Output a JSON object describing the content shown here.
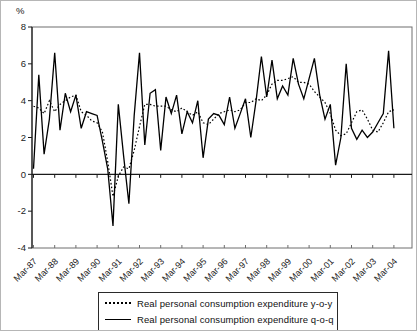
{
  "figure": {
    "y_axis_unit_label": "%",
    "colors": {
      "line": "#000000",
      "frame": "#6e6e6e",
      "axis": "#1a1a1a",
      "tick_text": "#222222",
      "background": "#ffffff"
    },
    "legend": [
      {
        "label": "Real personal consumption expenditure y-o-y",
        "style": "dotted"
      },
      {
        "label": "Real personal consumption expenditure q-o-q",
        "style": "solid"
      }
    ]
  },
  "chart_data": {
    "type": "line",
    "title": "",
    "ylabel": "%",
    "xlabel": "",
    "ylim": [
      -4,
      8
    ],
    "y_ticks": [
      8,
      6,
      4,
      2,
      0,
      -2,
      -4
    ],
    "grid": false,
    "zero_baseline": true,
    "legend_position": "bottom",
    "x_start": "Mar-87",
    "x_frequency": "quarterly",
    "x_points": 69,
    "x_tick_labels": [
      "Mar-87",
      "Mar-88",
      "Mar-89",
      "Mar-90",
      "Mar-91",
      "Mar-92",
      "Mar-93",
      "Mar-94",
      "Mar-95",
      "Mar-96",
      "Mar-97",
      "Mar-98",
      "Mar-99",
      "Mar-00",
      "Mar-01",
      "Mar-02",
      "Mar-03",
      "Mar-04"
    ],
    "series": [
      {
        "name": "Real personal consumption expenditure y-o-y",
        "style": "dotted",
        "values": [
          3.7,
          3.6,
          3.3,
          4.0,
          3.4,
          3.8,
          4.0,
          4.2,
          4.3,
          3.4,
          3.2,
          2.9,
          2.8,
          2.3,
          0.7,
          -1.2,
          -0.1,
          0.4,
          0.3,
          1.3,
          2.6,
          3.8,
          3.8,
          3.7,
          3.7,
          3.7,
          3.5,
          3.4,
          3.6,
          3.4,
          3.2,
          3.4,
          2.8,
          2.7,
          3.0,
          3.3,
          3.4,
          3.5,
          3.4,
          3.5,
          3.9,
          3.9,
          4.1,
          4.0,
          4.3,
          4.9,
          5.1,
          5.1,
          5.2,
          5.3,
          5.0,
          5.0,
          4.9,
          4.5,
          4.2,
          3.9,
          3.3,
          2.4,
          2.1,
          2.2,
          2.8,
          3.4,
          3.5,
          3.0,
          2.4,
          2.3,
          2.8,
          3.4,
          3.5
        ]
      },
      {
        "name": "Real personal consumption expenditure q-o-q",
        "style": "solid",
        "values": [
          0.3,
          5.4,
          1.1,
          3.0,
          6.6,
          2.4,
          4.4,
          3.4,
          4.3,
          2.5,
          3.4,
          3.3,
          3.2,
          1.8,
          0.3,
          -2.8,
          3.8,
          1.0,
          -1.6,
          3.2,
          6.6,
          1.6,
          4.4,
          4.6,
          1.3,
          4.2,
          3.3,
          4.3,
          2.2,
          3.4,
          2.8,
          4.0,
          0.9,
          3.0,
          3.3,
          3.2,
          2.7,
          4.2,
          2.5,
          3.3,
          4.1,
          2.0,
          4.0,
          6.4,
          4.2,
          6.2,
          4.1,
          4.8,
          4.3,
          6.3,
          4.9,
          4.1,
          5.2,
          6.3,
          4.3,
          3.0,
          3.8,
          0.5,
          2.0,
          6.0,
          2.5,
          1.9,
          2.4,
          2.0,
          2.3,
          2.8,
          3.3,
          6.7,
          2.5
        ]
      }
    ]
  }
}
